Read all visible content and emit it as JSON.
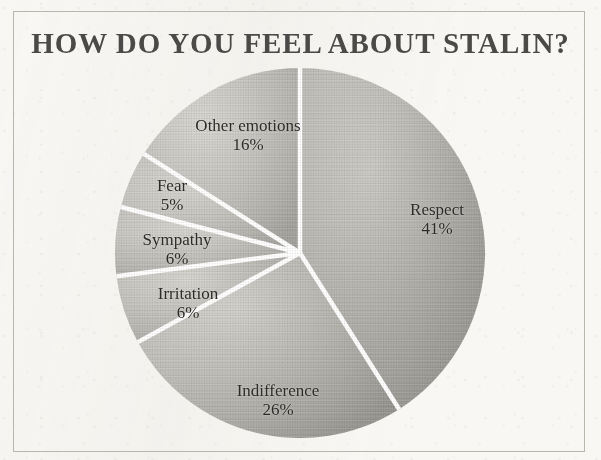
{
  "figure": {
    "title": "HOW DO YOU FEEL ABOUT STALIN?",
    "frame_color": "#b9b6ae",
    "background_color": "#f8f7f4",
    "title_color": "#4b4a48",
    "slice_fill_color": "#b9b7b2",
    "slice_divider_color": "#ffffff"
  },
  "chart_data": {
    "type": "pie",
    "title": "HOW DO YOU FEEL ABOUT STALIN?",
    "xlabel": "",
    "ylabel": "",
    "units": "percent",
    "start_angle_deg": 0,
    "direction": "clockwise",
    "legend": "none",
    "grid": false,
    "labels_inside_slices": true,
    "categories": [
      "Respect",
      "Indifference",
      "Irritation",
      "Sympathy",
      "Fear",
      "Other emotions"
    ],
    "values": [
      41,
      26,
      6,
      6,
      5,
      16
    ],
    "slices": [
      {
        "label": "Respect",
        "value": 41,
        "pct_text": "41%",
        "label_x": 437,
        "label_y": 219
      },
      {
        "label": "Indifference",
        "value": 26,
        "pct_text": "26%",
        "label_x": 278,
        "label_y": 400
      },
      {
        "label": "Irritation",
        "value": 6,
        "pct_text": "6%",
        "label_x": 188,
        "label_y": 303
      },
      {
        "label": "Sympathy",
        "value": 6,
        "pct_text": "6%",
        "label_x": 177,
        "label_y": 249
      },
      {
        "label": "Fear",
        "value": 5,
        "pct_text": "5%",
        "label_x": 172,
        "label_y": 195
      },
      {
        "label": "Other emotions",
        "value": 16,
        "pct_text": "16%",
        "label_x": 248,
        "label_y": 135
      }
    ]
  }
}
